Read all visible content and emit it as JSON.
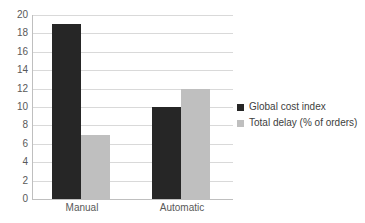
{
  "chart_data": {
    "type": "bar",
    "categories": [
      "Manual",
      "Automatic"
    ],
    "series": [
      {
        "name": "Global cost index",
        "color": "#262626",
        "values": [
          19,
          10
        ]
      },
      {
        "name": "Total delay (% of orders)",
        "color": "#bfbfbf",
        "values": [
          7,
          12
        ]
      }
    ],
    "title": "",
    "xlabel": "",
    "ylabel": "",
    "ylim": [
      0,
      20
    ],
    "ytick_step": 2,
    "grid": true,
    "legend_position": "right"
  },
  "style": {
    "background": "#ffffff",
    "grid_color": "#d9d9d9",
    "axis_color": "#bfbfbf",
    "text_color": "#595959",
    "legend_text_color": "#404040"
  }
}
